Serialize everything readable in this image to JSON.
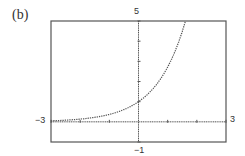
{
  "figure": {
    "label": "(b)"
  },
  "chart_data": {
    "type": "line",
    "title": "(b)",
    "function": "y = e^x",
    "xlabel": "",
    "ylabel": "",
    "xlim": [
      -3,
      3
    ],
    "ylim": [
      -1,
      5
    ],
    "x_tick_step": 1,
    "y_tick_step": 1,
    "window_labels": {
      "xmin": "−3",
      "xmax": "3",
      "ymin": "−1",
      "ymax": "5"
    },
    "grid": false,
    "legend": null,
    "style": "dotted graphing-calculator plot",
    "series": [
      {
        "name": "y = e^x",
        "x": [
          -3,
          -2.5,
          -2,
          -1.5,
          -1,
          -0.5,
          0,
          0.25,
          0.5,
          0.75,
          1,
          1.25,
          1.5,
          1.61
        ],
        "y": [
          0.05,
          0.08,
          0.14,
          0.22,
          0.37,
          0.61,
          1.0,
          1.28,
          1.65,
          2.12,
          2.72,
          3.49,
          4.48,
          5.0
        ]
      }
    ]
  },
  "colors": {
    "frame": "#555555",
    "axis": "#555555",
    "curve": "#555555",
    "background": "#ffffff"
  }
}
